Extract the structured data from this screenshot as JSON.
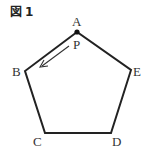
{
  "figure": {
    "title_prefix": "図",
    "title_number": "1"
  },
  "diagram": {
    "shape": "regular pentagon",
    "vertices": [
      {
        "label": "A",
        "x": 77,
        "y": 32
      },
      {
        "label": "B",
        "x": 25,
        "y": 71
      },
      {
        "label": "C",
        "x": 45,
        "y": 133
      },
      {
        "label": "D",
        "x": 111,
        "y": 133
      },
      {
        "label": "E",
        "x": 131,
        "y": 70
      }
    ],
    "point": {
      "label": "P",
      "at_vertex": "A"
    },
    "arrow": {
      "from": "A",
      "toward": "B",
      "description": "P moves from A toward B"
    },
    "labels": {
      "A": "A",
      "B": "B",
      "C": "C",
      "D": "D",
      "E": "E",
      "P": "P"
    },
    "stroke_color": "#222222"
  }
}
